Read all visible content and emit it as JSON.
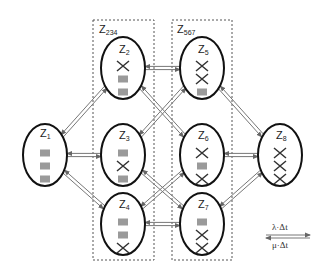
{
  "diagram": {
    "type": "state-transition-network",
    "colors": {
      "node_outline": "#111111",
      "unit_ok": "#9a9a9a",
      "unit_failed": "#333333",
      "arrow": "#777777",
      "group_box": "#555555"
    },
    "groups": [
      {
        "id": "Z234",
        "label_main": "Z",
        "label_sub": "234",
        "members": [
          "Z2",
          "Z3",
          "Z4"
        ]
      },
      {
        "id": "Z567",
        "label_main": "Z",
        "label_sub": "567",
        "members": [
          "Z5",
          "Z6",
          "Z7"
        ]
      }
    ],
    "nodes": [
      {
        "id": "Z1",
        "label_main": "Z",
        "label_sub": "1",
        "units": [
          "ok",
          "ok",
          "ok"
        ]
      },
      {
        "id": "Z2",
        "label_main": "Z",
        "label_sub": "2",
        "units": [
          "failed",
          "ok",
          "ok"
        ]
      },
      {
        "id": "Z3",
        "label_main": "Z",
        "label_sub": "3",
        "units": [
          "ok",
          "failed",
          "ok"
        ]
      },
      {
        "id": "Z4",
        "label_main": "Z",
        "label_sub": "4",
        "units": [
          "ok",
          "ok",
          "failed"
        ]
      },
      {
        "id": "Z5",
        "label_main": "Z",
        "label_sub": "5",
        "units": [
          "failed",
          "failed",
          "ok"
        ]
      },
      {
        "id": "Z6",
        "label_main": "Z",
        "label_sub": "6",
        "units": [
          "failed",
          "ok",
          "failed"
        ]
      },
      {
        "id": "Z7",
        "label_main": "Z",
        "label_sub": "7",
        "units": [
          "ok",
          "failed",
          "failed"
        ]
      },
      {
        "id": "Z8",
        "label_main": "Z",
        "label_sub": "8",
        "units": [
          "failed",
          "failed",
          "failed"
        ]
      }
    ],
    "edges": [
      {
        "from": "Z1",
        "to": "Z2"
      },
      {
        "from": "Z1",
        "to": "Z3"
      },
      {
        "from": "Z1",
        "to": "Z4"
      },
      {
        "from": "Z2",
        "to": "Z5"
      },
      {
        "from": "Z2",
        "to": "Z6"
      },
      {
        "from": "Z3",
        "to": "Z5"
      },
      {
        "from": "Z3",
        "to": "Z7"
      },
      {
        "from": "Z4",
        "to": "Z6"
      },
      {
        "from": "Z4",
        "to": "Z7"
      },
      {
        "from": "Z5",
        "to": "Z8"
      },
      {
        "from": "Z6",
        "to": "Z8"
      },
      {
        "from": "Z7",
        "to": "Z8"
      }
    ],
    "legend": {
      "forward_label": "λ·Δt",
      "backward_label": "μ·Δt"
    }
  }
}
